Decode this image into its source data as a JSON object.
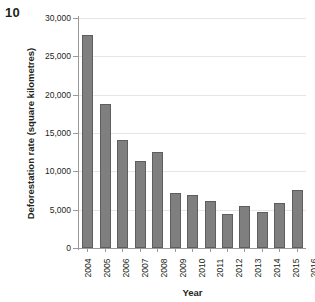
{
  "page_number": "10",
  "chart_data": {
    "type": "bar",
    "title": "",
    "xlabel": "Year",
    "ylabel": "Deforestation rate (square kilometres)",
    "categories": [
      "2004",
      "2005",
      "2006",
      "2007",
      "2008",
      "2009",
      "2010",
      "2011",
      "2012",
      "2013",
      "2014",
      "2015",
      "2016"
    ],
    "values": [
      27800,
      18800,
      14100,
      11300,
      12500,
      7200,
      6900,
      6100,
      4500,
      5500,
      4700,
      5900,
      7600
    ],
    "ylim": [
      0,
      30000
    ],
    "ytick_values": [
      0,
      5000,
      10000,
      15000,
      20000,
      25000,
      30000
    ],
    "ytick_labels": [
      "0",
      "5,000",
      "10,000",
      "15,000",
      "20,000",
      "25,000",
      "30,000"
    ],
    "grid": true,
    "legend": false,
    "bar_color": "#7f7f7f",
    "bar_border_color": "#5e5e5e",
    "gridline_color": "#e6e6e6",
    "axis_color": "#9a9a9a"
  }
}
